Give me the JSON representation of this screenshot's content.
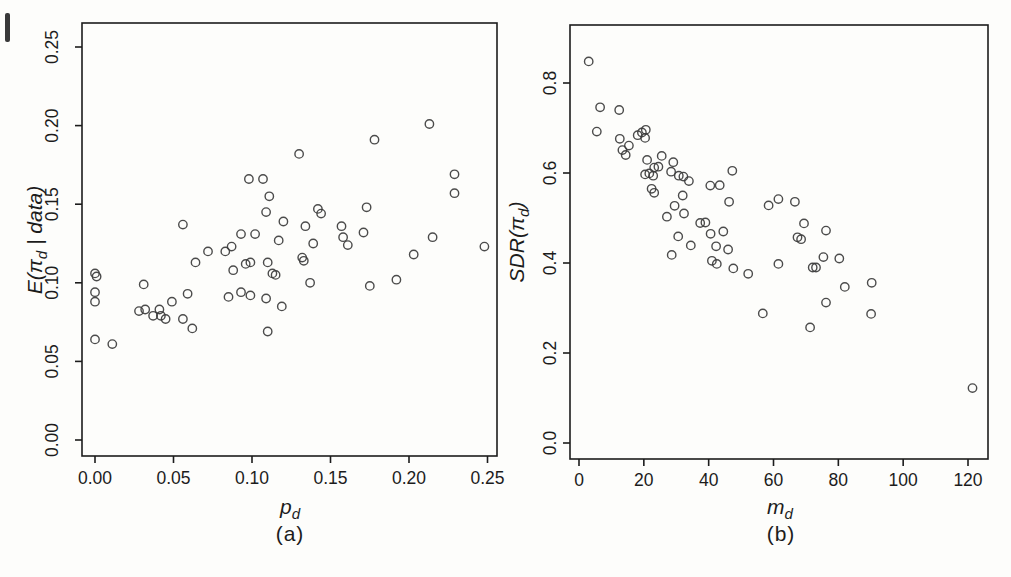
{
  "figure": {
    "background": "#fdfdfb",
    "ink_color": "#1c1c1c",
    "point_color": "#3c3c3c",
    "marker": "open-circle"
  },
  "chart_data": [
    {
      "type": "scatter",
      "panel": "left",
      "caption": "(a)",
      "xlabel": "p_{d}",
      "ylabel": "E(π_{d} | data)",
      "xlim": [
        0,
        0.25
      ],
      "ylim": [
        0,
        0.25
      ],
      "grid": false,
      "legend": null,
      "xticks": [
        {
          "v": 0.0,
          "label": "0.00"
        },
        {
          "v": 0.05,
          "label": "0.05"
        },
        {
          "v": 0.1,
          "label": "0.10"
        },
        {
          "v": 0.15,
          "label": "0.15"
        },
        {
          "v": 0.2,
          "label": "0.20"
        },
        {
          "v": 0.25,
          "label": "0.25"
        }
      ],
      "yticks": [
        {
          "v": 0.0,
          "label": "0.00"
        },
        {
          "v": 0.05,
          "label": "0.05"
        },
        {
          "v": 0.1,
          "label": "0.10"
        },
        {
          "v": 0.15,
          "label": "0.15"
        },
        {
          "v": 0.2,
          "label": "0.20"
        },
        {
          "v": 0.25,
          "label": "0.25"
        }
      ],
      "points": [
        [
          0.0,
          0.106
        ],
        [
          0.001,
          0.104
        ],
        [
          0.0,
          0.094
        ],
        [
          0.0,
          0.088
        ],
        [
          0.0,
          0.064
        ],
        [
          0.011,
          0.061
        ],
        [
          0.031,
          0.099
        ],
        [
          0.028,
          0.082
        ],
        [
          0.032,
          0.083
        ],
        [
          0.037,
          0.079
        ],
        [
          0.041,
          0.083
        ],
        [
          0.042,
          0.079
        ],
        [
          0.045,
          0.077
        ],
        [
          0.049,
          0.088
        ],
        [
          0.056,
          0.077
        ],
        [
          0.059,
          0.093
        ],
        [
          0.062,
          0.071
        ],
        [
          0.056,
          0.137
        ],
        [
          0.064,
          0.113
        ],
        [
          0.072,
          0.12
        ],
        [
          0.083,
          0.12
        ],
        [
          0.087,
          0.123
        ],
        [
          0.093,
          0.131
        ],
        [
          0.102,
          0.131
        ],
        [
          0.117,
          0.127
        ],
        [
          0.088,
          0.108
        ],
        [
          0.096,
          0.112
        ],
        [
          0.099,
          0.113
        ],
        [
          0.11,
          0.113
        ],
        [
          0.113,
          0.106
        ],
        [
          0.115,
          0.105
        ],
        [
          0.085,
          0.091
        ],
        [
          0.093,
          0.094
        ],
        [
          0.099,
          0.092
        ],
        [
          0.109,
          0.09
        ],
        [
          0.119,
          0.085
        ],
        [
          0.11,
          0.069
        ],
        [
          0.098,
          0.166
        ],
        [
          0.107,
          0.166
        ],
        [
          0.111,
          0.155
        ],
        [
          0.109,
          0.145
        ],
        [
          0.12,
          0.139
        ],
        [
          0.13,
          0.182
        ],
        [
          0.178,
          0.191
        ],
        [
          0.213,
          0.201
        ],
        [
          0.229,
          0.169
        ],
        [
          0.229,
          0.157
        ],
        [
          0.142,
          0.147
        ],
        [
          0.144,
          0.144
        ],
        [
          0.173,
          0.148
        ],
        [
          0.134,
          0.136
        ],
        [
          0.157,
          0.136
        ],
        [
          0.171,
          0.132
        ],
        [
          0.158,
          0.129
        ],
        [
          0.161,
          0.124
        ],
        [
          0.139,
          0.125
        ],
        [
          0.132,
          0.116
        ],
        [
          0.133,
          0.114
        ],
        [
          0.215,
          0.129
        ],
        [
          0.248,
          0.123
        ],
        [
          0.203,
          0.118
        ],
        [
          0.137,
          0.1
        ],
        [
          0.175,
          0.098
        ],
        [
          0.192,
          0.102
        ]
      ]
    },
    {
      "type": "scatter",
      "panel": "right",
      "caption": "(b)",
      "xlabel": "m_{d}",
      "ylabel": "SDR(π_{d})",
      "xlim": [
        0,
        120
      ],
      "ylim": [
        0,
        0.8
      ],
      "grid": false,
      "legend": null,
      "xticks": [
        {
          "v": 0,
          "label": "0"
        },
        {
          "v": 20,
          "label": "20"
        },
        {
          "v": 40,
          "label": "40"
        },
        {
          "v": 60,
          "label": "60"
        },
        {
          "v": 80,
          "label": "80"
        },
        {
          "v": 100,
          "label": "100"
        },
        {
          "v": 120,
          "label": "120"
        }
      ],
      "yticks": [
        {
          "v": 0.0,
          "label": "0.0"
        },
        {
          "v": 0.2,
          "label": "0.2"
        },
        {
          "v": 0.4,
          "label": "0.4"
        },
        {
          "v": 0.6,
          "label": "0.6"
        },
        {
          "v": 0.8,
          "label": "0.8"
        }
      ],
      "points": [
        [
          3,
          0.848
        ],
        [
          6.5,
          0.746
        ],
        [
          12.4,
          0.74
        ],
        [
          5.5,
          0.692
        ],
        [
          12.6,
          0.676
        ],
        [
          13.4,
          0.651
        ],
        [
          14.4,
          0.64
        ],
        [
          15.4,
          0.661
        ],
        [
          18.1,
          0.684
        ],
        [
          19.4,
          0.69
        ],
        [
          20.6,
          0.696
        ],
        [
          20.4,
          0.678
        ],
        [
          21.0,
          0.629
        ],
        [
          25.5,
          0.638
        ],
        [
          23.2,
          0.612
        ],
        [
          24.5,
          0.614
        ],
        [
          20.4,
          0.597
        ],
        [
          21.7,
          0.599
        ],
        [
          22.9,
          0.594
        ],
        [
          29.1,
          0.624
        ],
        [
          28.4,
          0.603
        ],
        [
          30.8,
          0.594
        ],
        [
          32.2,
          0.592
        ],
        [
          33.9,
          0.582
        ],
        [
          22.4,
          0.565
        ],
        [
          23.2,
          0.556
        ],
        [
          27.1,
          0.503
        ],
        [
          29.5,
          0.527
        ],
        [
          32.0,
          0.55
        ],
        [
          40.5,
          0.572
        ],
        [
          43.4,
          0.573
        ],
        [
          47.3,
          0.605
        ],
        [
          46.3,
          0.536
        ],
        [
          32.4,
          0.51
        ],
        [
          37.4,
          0.489
        ],
        [
          39.0,
          0.49
        ],
        [
          30.6,
          0.459
        ],
        [
          40.6,
          0.465
        ],
        [
          44.5,
          0.47
        ],
        [
          34.5,
          0.439
        ],
        [
          42.3,
          0.437
        ],
        [
          46.0,
          0.43
        ],
        [
          28.6,
          0.418
        ],
        [
          41.0,
          0.405
        ],
        [
          42.5,
          0.398
        ],
        [
          47.6,
          0.388
        ],
        [
          52.2,
          0.376
        ],
        [
          58.5,
          0.528
        ],
        [
          61.5,
          0.542
        ],
        [
          66.6,
          0.536
        ],
        [
          69.4,
          0.488
        ],
        [
          67.4,
          0.457
        ],
        [
          68.5,
          0.453
        ],
        [
          76.2,
          0.472
        ],
        [
          61.5,
          0.398
        ],
        [
          75.4,
          0.413
        ],
        [
          80.3,
          0.41
        ],
        [
          72.1,
          0.39
        ],
        [
          73.1,
          0.39
        ],
        [
          82.0,
          0.347
        ],
        [
          90.3,
          0.356
        ],
        [
          76.2,
          0.312
        ],
        [
          90.1,
          0.287
        ],
        [
          56.7,
          0.288
        ],
        [
          71.3,
          0.257
        ],
        [
          121.4,
          0.122
        ]
      ]
    }
  ]
}
